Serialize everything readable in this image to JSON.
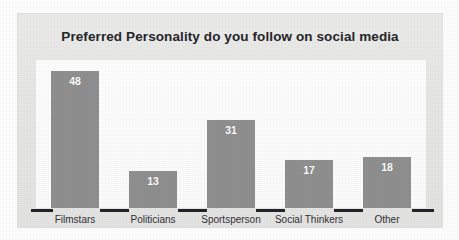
{
  "chart_data": {
    "type": "bar",
    "title": "Preferred Personality do you follow on social media",
    "categories": [
      "Filmstars",
      "Politicians",
      "Sportsperson",
      "Social Thinkers",
      "Other"
    ],
    "values": [
      48,
      13,
      31,
      17,
      18
    ],
    "xlabel": "",
    "ylabel": "",
    "ylim": [
      0,
      52
    ],
    "grid": false,
    "legend": false,
    "legend_position": "none",
    "data_labels": [
      "48",
      "13",
      "31",
      "17",
      "18"
    ],
    "data_label_position": "inside-top",
    "axis": {
      "baseline_ticks": true,
      "y_axis_visible": false,
      "y_tick_labels": []
    },
    "colors": {
      "bar": "#8f8f8f",
      "data_label": "#ffffff",
      "title": "#26262a",
      "category_label": "#303036",
      "plot_background": "#fcfcfc",
      "panel_background": "#e7e7e6",
      "axis_tick": "#23232a",
      "page_background": "#fdfdfd"
    }
  }
}
